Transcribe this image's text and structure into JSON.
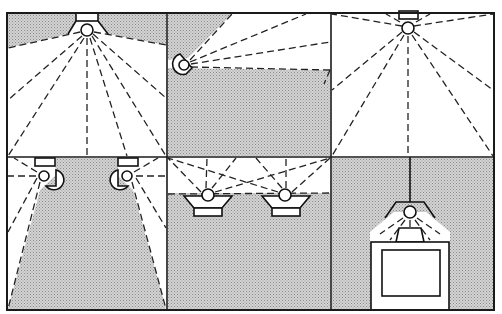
{
  "figure": {
    "type": "lighting-layout-diagram",
    "grid": {
      "rows": 2,
      "columns": 3
    },
    "colors": {
      "line": "#1a1a1a",
      "shaded_area": "#c8c8c8",
      "lit_area": "#ffffff"
    },
    "panels": [
      {
        "id": 1,
        "position": "top-left",
        "fixture": "ceiling-mounted downlight, centered",
        "fixture_count": 1,
        "shading": "upper corners shaded, floor lit"
      },
      {
        "id": 2,
        "position": "top-center",
        "fixture": "wall-mounted spotlight aimed right/up",
        "fixture_count": 1,
        "shading": "lower half and upper-left corner shaded, upper band lit"
      },
      {
        "id": 3,
        "position": "top-right",
        "fixture": "ceiling-mounted downlight, centered",
        "fixture_count": 1,
        "shading": "fully lit"
      },
      {
        "id": 4,
        "position": "bottom-left",
        "fixture": "two wall-mounted lights near ceiling",
        "fixture_count": 2,
        "shading": "center trapezoid shaded, sides lit"
      },
      {
        "id": 5,
        "position": "bottom-center",
        "fixture": "two uplights aimed at ceiling",
        "fixture_count": 2,
        "shading": "ceiling band lit, rest shaded"
      },
      {
        "id": 6,
        "position": "bottom-right",
        "fixture": "pendant task light over desk/monitor",
        "fixture_count": 1,
        "shading": "mostly shaded, task area lit"
      }
    ]
  }
}
